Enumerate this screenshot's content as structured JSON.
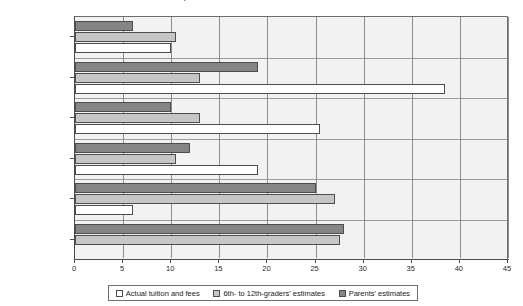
{
  "chart_data": {
    "type": "bar",
    "orientation": "horizontal",
    "title": "by Actual Tuition Cost and Parent/Student Income",
    "xlabel": "",
    "ylabel": "",
    "xlim": [
      0,
      45
    ],
    "xticks": [
      0,
      5,
      10,
      15,
      20,
      25,
      30,
      35,
      40,
      45
    ],
    "grid": true,
    "legend_position": "bottom",
    "categories": [
      "Less than $2,000",
      "$2,000-2999",
      "$3,000-3,999",
      "$4,000-4,999",
      "$5,000-7,999",
      "$8,000 or more"
    ],
    "series": [
      {
        "name": "Actual tuition and fees",
        "color": "#ffffff",
        "values": [
          10.0,
          38.5,
          25.5,
          19.0,
          6.0,
          0.0
        ]
      },
      {
        "name": "6th- to 12th-graders' estimates",
        "color": "#c6c6c6",
        "values": [
          10.5,
          13.0,
          13.0,
          10.5,
          27.0,
          27.5
        ]
      },
      {
        "name": "Parents' estimates",
        "color": "#858585",
        "values": [
          6.0,
          19.0,
          10.0,
          12.0,
          25.0,
          28.0
        ]
      }
    ]
  },
  "legend": {
    "items": [
      {
        "label": "Actual tuition and fees",
        "swatch": "s-actual"
      },
      {
        "label": "6th- to 12th-graders' estimates",
        "swatch": "s-students"
      },
      {
        "label": "Parents' estimates",
        "swatch": "s-parents"
      }
    ]
  }
}
